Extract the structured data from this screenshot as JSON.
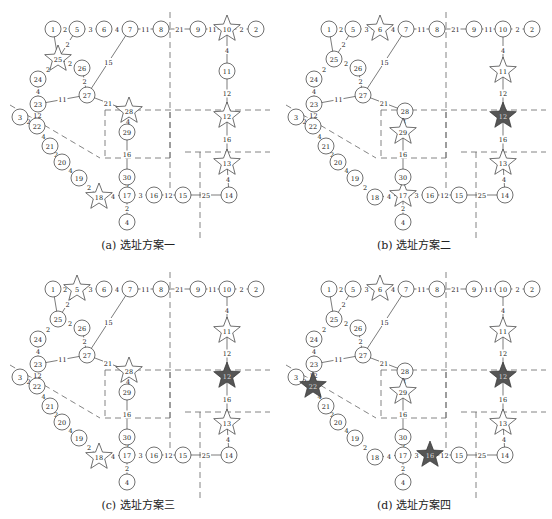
{
  "figure": {
    "nodes": {
      "1": [
        53,
        9
      ],
      "5": [
        77,
        9
      ],
      "6": [
        104,
        9
      ],
      "7": [
        130,
        9
      ],
      "8": [
        161,
        9
      ],
      "9": [
        198,
        9
      ],
      "10": [
        227,
        9
      ],
      "2": [
        256,
        9
      ],
      "25": [
        58,
        39
      ],
      "26": [
        82,
        48
      ],
      "24": [
        38,
        59
      ],
      "27": [
        87,
        75
      ],
      "23": [
        38,
        84
      ],
      "28": [
        129,
        91
      ],
      "3": [
        20,
        97
      ],
      "11": [
        227,
        51
      ],
      "22": [
        37,
        106
      ],
      "29": [
        127,
        112
      ],
      "12": [
        227,
        96
      ],
      "21": [
        50,
        126
      ],
      "20": [
        62,
        142
      ],
      "13": [
        227,
        143
      ],
      "30": [
        127,
        157
      ],
      "19": [
        79,
        158
      ],
      "18": [
        99,
        177
      ],
      "17": [
        127,
        175
      ],
      "16": [
        154,
        175
      ],
      "15": [
        183,
        175
      ],
      "14": [
        229,
        175
      ],
      "4": [
        127,
        202
      ]
    },
    "edges": [
      [
        "1",
        "5",
        "2"
      ],
      [
        "5",
        "6",
        "3"
      ],
      [
        "6",
        "7",
        "4"
      ],
      [
        "7",
        "8",
        "11"
      ],
      [
        "8",
        "9",
        "21"
      ],
      [
        "9",
        "10",
        "11"
      ],
      [
        "10",
        "2",
        "2"
      ],
      [
        "5",
        "25",
        "2"
      ],
      [
        "1",
        "25",
        ""
      ],
      [
        "25",
        "26",
        "2"
      ],
      [
        "25",
        "24",
        "2"
      ],
      [
        "26",
        "27",
        "2"
      ],
      [
        "24",
        "23",
        "4"
      ],
      [
        "7",
        "27",
        "15"
      ],
      [
        "23",
        "27",
        "11"
      ],
      [
        "27",
        "28",
        "21"
      ],
      [
        "28",
        "29",
        "4"
      ],
      [
        "29",
        "30",
        "16"
      ],
      [
        "30",
        "17",
        "2"
      ],
      [
        "10",
        "11",
        "4"
      ],
      [
        "11",
        "12",
        "12"
      ],
      [
        "12",
        "13",
        "16"
      ],
      [
        "13",
        "14",
        "4"
      ],
      [
        "23",
        "22",
        "12"
      ],
      [
        "3",
        "22",
        "2"
      ],
      [
        "22",
        "21",
        "4"
      ],
      [
        "21",
        "20",
        "2"
      ],
      [
        "20",
        "19",
        "4"
      ],
      [
        "19",
        "18",
        "2"
      ],
      [
        "18",
        "17",
        "4"
      ],
      [
        "17",
        "16",
        "3"
      ],
      [
        "16",
        "15",
        "12"
      ],
      [
        "15",
        "14",
        "25"
      ],
      [
        "17",
        "4",
        "2"
      ]
    ],
    "dashed_lines": [
      [
        [
          170,
          -8
        ],
        [
          170,
          175
        ]
      ],
      [
        [
          105,
          90
        ],
        [
          270,
          90
        ]
      ],
      [
        [
          105,
          90
        ],
        [
          105,
          138
        ]
      ],
      [
        [
          105,
          138
        ],
        [
          170,
          138
        ]
      ],
      [
        [
          170,
          138
        ],
        [
          170,
          90
        ]
      ],
      [
        [
          10,
          85
        ],
        [
          100,
          138
        ]
      ],
      [
        [
          185,
          132
        ],
        [
          270,
          132
        ]
      ],
      [
        [
          200,
          132
        ],
        [
          200,
          225
        ]
      ]
    ]
  },
  "panels": [
    {
      "id": "a",
      "caption": "(a) 选址方案一",
      "offset": [
        0,
        0
      ],
      "stars_hollow": [
        "25",
        "10",
        "28",
        "12",
        "13",
        "18"
      ],
      "stars_filled": []
    },
    {
      "id": "b",
      "caption": "(b) 选址方案二",
      "offset": [
        276,
        0
      ],
      "stars_hollow": [
        "6",
        "11",
        "29",
        "13",
        "17"
      ],
      "stars_filled": [
        "12"
      ]
    },
    {
      "id": "c",
      "caption": "(c) 选址方案三",
      "offset": [
        0,
        260
      ],
      "stars_hollow": [
        "5",
        "28",
        "11",
        "13",
        "18"
      ],
      "stars_filled": [
        "12"
      ]
    },
    {
      "id": "d",
      "caption": "(d) 选址方案四",
      "offset": [
        276,
        260
      ],
      "stars_hollow": [
        "6",
        "11",
        "29",
        "13"
      ],
      "stars_filled": [
        "12",
        "22",
        "16"
      ]
    }
  ],
  "colors": {
    "line": "#444444",
    "node_fill": "#ffffff",
    "star_filled": "#555555",
    "dash": "#666666",
    "text": "#222222"
  }
}
